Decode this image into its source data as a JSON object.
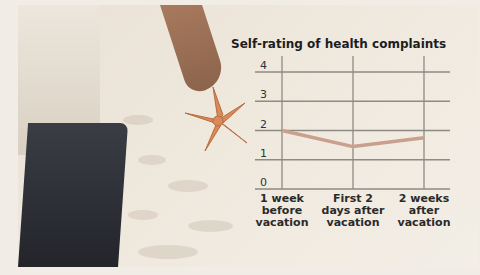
{
  "chart_data": {
    "type": "line",
    "title": "Self-rating of health complaints",
    "xlabel": "",
    "ylabel": "",
    "categories": [
      "1 week before vacation",
      "First 2 days after vacation",
      "2 weeks after vacation"
    ],
    "category_lines": [
      [
        "1 week",
        "before",
        "vacation"
      ],
      [
        "First 2",
        "days after",
        "vacation"
      ],
      [
        "2 weeks",
        "after",
        "vacation"
      ]
    ],
    "series": [
      {
        "name": "Self-rating of health complaints",
        "values": [
          2.0,
          1.45,
          1.75
        ]
      }
    ],
    "ylim": [
      0,
      4
    ],
    "yticks": [
      "0",
      "1",
      "2",
      "3",
      "4"
    ],
    "grid": true,
    "legend": "none",
    "colors": {
      "line": "#c9a08e",
      "grid": "#8e8a84"
    }
  }
}
